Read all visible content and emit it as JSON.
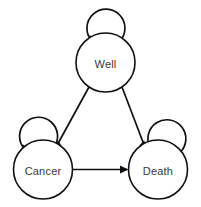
{
  "diagram": {
    "type": "state-transition-diagram",
    "title": "",
    "background_color": "#ffffff",
    "stroke_color": "#101010",
    "label_color": "#3a3a3a",
    "nodes": [
      {
        "id": "well",
        "label": "Well",
        "cx": 105.5,
        "cy": 62.5,
        "r": 29.5
      },
      {
        "id": "cancer",
        "label": "Cancer",
        "cx": 43.0,
        "cy": 169.5,
        "r": 29.5
      },
      {
        "id": "death",
        "label": "Death",
        "cx": 158.0,
        "cy": 169.5,
        "r": 29.5
      }
    ],
    "edges": [
      {
        "id": "well-to-cancer",
        "from": "Well",
        "to": "Cancer",
        "kind": "directed"
      },
      {
        "id": "well-to-death",
        "from": "Well",
        "to": "Death",
        "kind": "directed"
      },
      {
        "id": "cancer-to-death",
        "from": "Cancer",
        "to": "Death",
        "kind": "directed"
      }
    ],
    "self_loops": [
      {
        "id": "well-self-loop",
        "node": "Well",
        "position": "top"
      },
      {
        "id": "cancer-self-loop",
        "node": "Cancer",
        "position": "top-left"
      },
      {
        "id": "death-self-loop",
        "node": "Death",
        "position": "top-right"
      }
    ]
  }
}
